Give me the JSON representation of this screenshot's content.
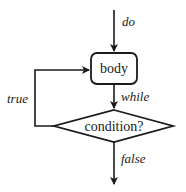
{
  "diagram": {
    "type": "flowchart",
    "nodes": {
      "body": {
        "label": "body",
        "shape": "rounded-rectangle"
      },
      "condition": {
        "label": "condition?",
        "shape": "diamond"
      }
    },
    "edges": {
      "entry": {
        "label": "do",
        "from": "start",
        "to": "body"
      },
      "body_to_condition": {
        "label": "while",
        "from": "body",
        "to": "condition"
      },
      "loop_back": {
        "label": "true",
        "from": "condition",
        "to": "body"
      },
      "exit": {
        "label": "false",
        "from": "condition",
        "to": "end"
      }
    }
  }
}
